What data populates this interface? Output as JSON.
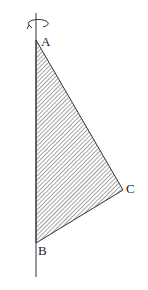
{
  "diagram": {
    "type": "geometry-rotation",
    "axis": {
      "x": 36,
      "y_top": 13,
      "y_bottom": 277,
      "color": "#333333"
    },
    "rotation_arrow": {
      "cx": 37,
      "cy": 23,
      "rx": 10,
      "ry": 4,
      "direction": "counterclockwise-front"
    },
    "triangle": {
      "vertices": {
        "A": {
          "x": 36,
          "y": 40
        },
        "B": {
          "x": 36,
          "y": 243
        },
        "C": {
          "x": 123,
          "y": 190
        }
      },
      "fill": "hatched",
      "stroke_color": "#333333",
      "hatch_color": "#555555"
    },
    "labels": {
      "A": "A",
      "B": "B",
      "C": "C"
    }
  }
}
